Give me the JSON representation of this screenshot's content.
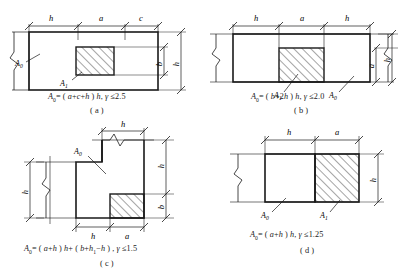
{
  "figure": {
    "type": "engineering-diagram",
    "line_color": "#1a1a1a",
    "hatch_color": "#1a1a1a",
    "background": "#ffffff"
  },
  "panels": [
    {
      "key": "a",
      "label": "( a )",
      "formula_parts": {
        "lhs": "A",
        "lhs_sub": "0",
        "eq": "= ( ",
        "expr": "a+c+h",
        "close": " ) ",
        "mult": "h",
        "comma": ", ",
        "gamma": "γ",
        "limit": " ≤2.5"
      },
      "formula_text": "A0= ( a+c+h ) h, γ ≤2.5",
      "top_dims": [
        "h",
        "a",
        "c"
      ],
      "right_dims": [
        "b",
        "h"
      ],
      "area_labels": [
        "A0",
        "A1"
      ],
      "break_side": "left"
    },
    {
      "key": "b",
      "label": "( b )",
      "formula_parts": {
        "lhs": "A",
        "lhs_sub": "0",
        "eq": "= ( ",
        "expr": "b+2h",
        "close": " ) ",
        "mult": "h",
        "comma": ", ",
        "gamma": "γ",
        "limit": " ≤2.0"
      },
      "formula_text": "A0= ( b+2h ) h, γ ≤2.0",
      "top_dims": [
        "h",
        "a",
        "h"
      ],
      "right_dims": [
        "a",
        "h"
      ],
      "area_labels": [
        "A1",
        "A0"
      ],
      "break_side": "both"
    },
    {
      "key": "c",
      "label": "( c )",
      "formula_parts": {
        "lhs": "A",
        "lhs_sub": "0",
        "eq": "= ( ",
        "expr": "a+h",
        "close": " ) ",
        "mult": "h",
        "plus": "+ ( ",
        "expr2": "b+h",
        "expr2_sub": "1",
        "expr2_end": "−h",
        "close2": " ) ",
        "comma": ", ",
        "gamma": "γ",
        "limit": " ≤1.5"
      },
      "formula_text": "A0= ( a+h ) h+ ( b+h1−h ) , γ ≤1.5",
      "top_dims": [
        "h"
      ],
      "bottom_dims": [
        "h",
        "a"
      ],
      "left_dims": [
        "h"
      ],
      "right_dims": [
        "h",
        "b"
      ],
      "area_labels": [
        "A0"
      ],
      "break_side": "left-and-top"
    },
    {
      "key": "d",
      "label": "( d )",
      "formula_parts": {
        "lhs": "A",
        "lhs_sub": "0",
        "eq": "= ( ",
        "expr": "a+h",
        "close": " ) ",
        "mult": "h",
        "comma": ", ",
        "gamma": "γ",
        "limit": " ≤1.25"
      },
      "formula_text": "A0= ( a+h ) h, γ ≤1.25",
      "top_dims": [
        "h",
        "a"
      ],
      "right_dims": [
        "h"
      ],
      "area_labels": [
        "A0",
        "A1"
      ],
      "break_side": "left"
    }
  ],
  "symbols": {
    "A0": "A",
    "A0_sub": "0",
    "A1": "A",
    "A1_sub": "1",
    "h": "h",
    "a": "a",
    "b": "b",
    "c": "c",
    "h1": "h",
    "h1_sub": "1",
    "gamma": "γ"
  }
}
